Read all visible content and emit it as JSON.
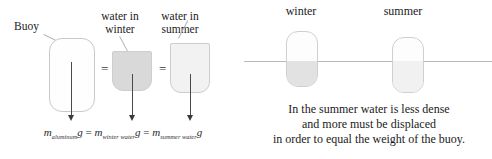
{
  "figure": {
    "left_panel": {
      "buoy_label": "Buoy",
      "water_winter_label_line1": "water in",
      "water_winter_label_line2": "winter",
      "water_summer_label_line1": "water in",
      "water_summer_label_line2": "summer",
      "equals_sign_1": "=",
      "equals_sign_2": "=",
      "equation": {
        "term1_symbol": "m",
        "term1_subscript": "aluminum",
        "term1_g": "g",
        "eq1": "=",
        "term2_symbol": "m",
        "term2_subscript": "winter water",
        "term2_g": "g",
        "eq2": "=",
        "term3_symbol": "m",
        "term3_subscript": "summer water",
        "term3_g": "g",
        "plain_text": "m_aluminum g = m_winter water g = m_summer water g"
      }
    },
    "right_panel": {
      "winter_label": "winter",
      "summer_label": "summer",
      "caption_line1": "In the summer water is less dense",
      "caption_line2": "and more must be displaced",
      "caption_line3": "in order to equal the weight of the buoy."
    },
    "colors": {
      "background": "#ffffff",
      "outline": "#c9c9c9",
      "winter_water_fill": "#d9d9d9",
      "summer_water_fill": "#f2f2f2",
      "submerged_fill": "#e2e2e2",
      "arrow": "#3a3a3a",
      "text": "#1a1a1a",
      "waterline": "#b9b9b9"
    }
  }
}
